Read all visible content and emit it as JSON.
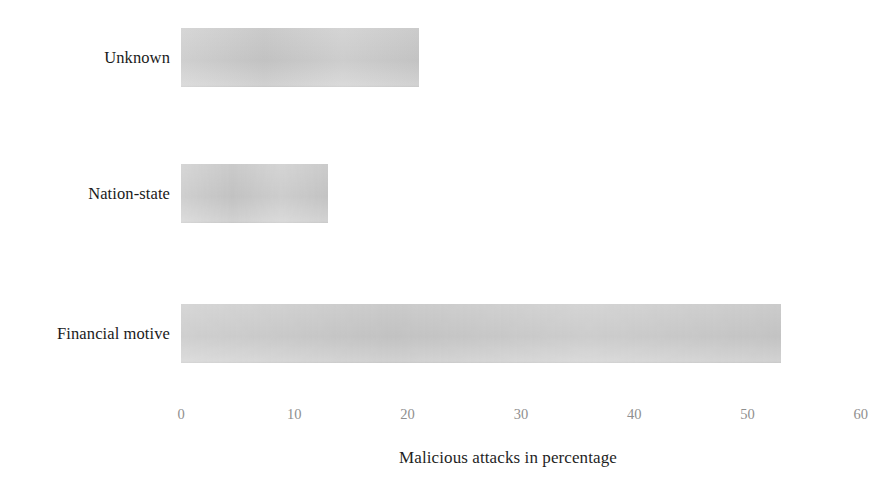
{
  "chart_data": {
    "type": "bar",
    "orientation": "horizontal",
    "title": "",
    "subtitle": "",
    "xlabel": "Malicious attacks in percentage",
    "ylabel": "",
    "categories": [
      "Financial motive",
      "Nation-state",
      "Unknown"
    ],
    "values": [
      53,
      13,
      21
    ],
    "series": [
      {
        "name": "Malicious attacks in percentage",
        "values": [
          53,
          13,
          21
        ]
      }
    ],
    "xlim": [
      0,
      60
    ],
    "xticks": [
      0,
      10,
      20,
      30,
      40,
      50,
      60
    ],
    "xticklabels": [
      "0",
      "10",
      "20",
      "30",
      "40",
      "50",
      "60"
    ],
    "grid": false,
    "legend": false,
    "legend_position": "none",
    "bar_color": "#c9c9c9",
    "label_color": "#1a1a1a",
    "tick_color": "#8f8f8f",
    "background_color": "#ffffff",
    "annotations": []
  },
  "bars": [
    {
      "label": "Unknown",
      "value": 21,
      "top": 28,
      "color": "#c9c9c9"
    },
    {
      "label": "Nation-state",
      "value": 13,
      "top": 164,
      "color": "#c9c9c9"
    },
    {
      "label": "Financial motive",
      "value": 53,
      "top": 304,
      "color": "#c9c9c9"
    }
  ],
  "axis": {
    "ticks": [
      {
        "label": "0",
        "value": 0
      },
      {
        "label": "10",
        "value": 10
      },
      {
        "label": "20",
        "value": 20
      },
      {
        "label": "30",
        "value": 30
      },
      {
        "label": "40",
        "value": 40
      },
      {
        "label": "50",
        "value": 50
      },
      {
        "label": "60",
        "value": 60
      }
    ],
    "title": "Malicious attacks in percentage"
  }
}
